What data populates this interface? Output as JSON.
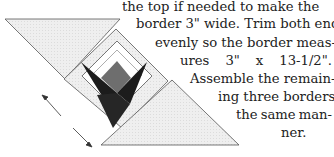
{
  "text": {
    "lines": [
      "the top if needed to make the",
      "border 3\" wide. Trim both ends",
      "evenly so the border meas-",
      "ures 3\" x 13-1/2\".",
      "Assemble the remain-",
      "ing three borders in",
      "the same man-",
      "ner."
    ],
    "justified_words_line4": [
      "ures",
      "3\"",
      "x",
      "13-1/2\"."
    ],
    "justified_words_line7": [
      "the",
      "same",
      "man-"
    ]
  },
  "diagram": {
    "colors": {
      "light": "#ececec",
      "white": "#ffffff",
      "dark": "#1c1c1c",
      "gray": "#6e6e6e",
      "outline": "#555555"
    }
  }
}
